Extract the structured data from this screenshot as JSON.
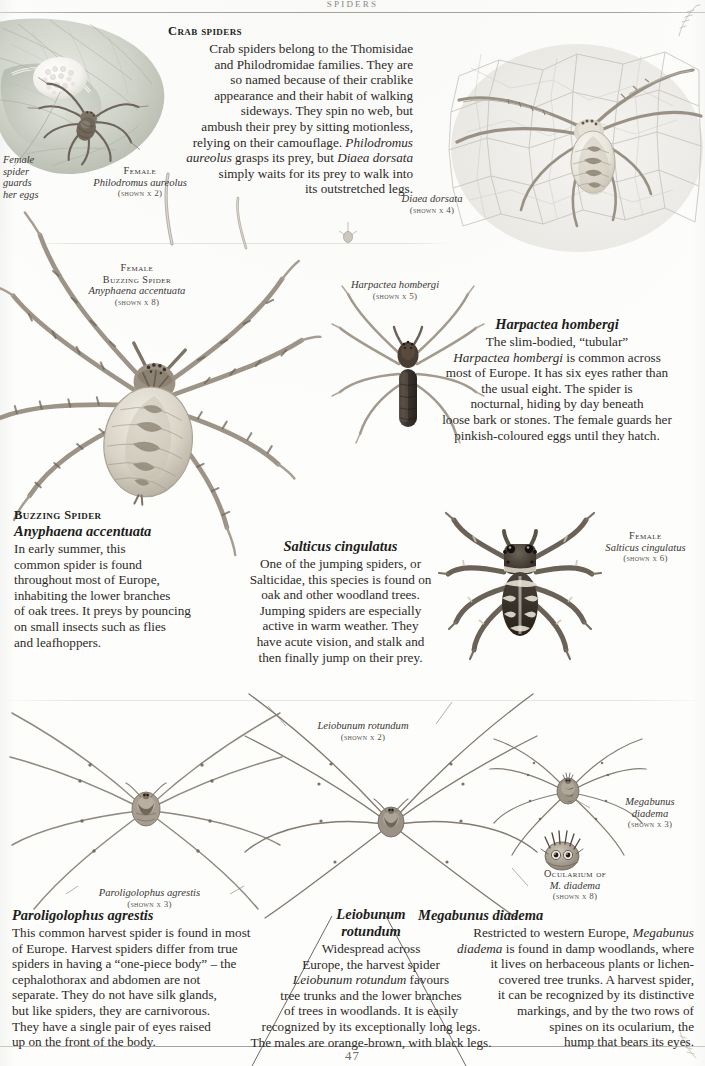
{
  "page": {
    "running_head": "SPIDERS",
    "page_number": "47"
  },
  "sections": {
    "crab_spiders": {
      "heading": "Crab spiders",
      "body": "Crab spiders belong to the Thomisidae and Philodromidae families. They are so named because of their crablike appearance and their habit of walking sideways. They spin no web, but ambush their prey by sitting motionless, relying on their camouflage. Philodromus aureolus grasps its prey, but Diaea dorsata simply waits for its prey to walk into its outstretched legs.",
      "body_lines": [
        "Crab spiders belong to the Thomisidae",
        "and Philodromidae families. They are",
        "so named because of their crablike",
        "appearance and their habit of walking",
        "sideways. They spin no web, but",
        "ambush their prey by sitting motionless,",
        "relying on their camouflage. <i>Philodromus</i>",
        "<i>aureolus</i> grasps its prey, but <i>Diaea dorsata</i>",
        "simply waits for its prey to walk into",
        "its outstretched legs."
      ]
    },
    "harpactea": {
      "heading": "Harpactea hombergi",
      "body_lines": [
        "The slim-bodied, “tubular”",
        "<i>Harpactea hombergi</i> is common across",
        "most of Europe. It has six eyes rather than",
        "the usual eight. The spider is",
        "nocturnal, hiding by day beneath",
        "loose bark or stones. The female guards her",
        "pinkish-coloured eggs until they hatch."
      ]
    },
    "buzzing_spider": {
      "heading_sc": "Buzzing Spider",
      "heading_it": "Anyphaena accentuata",
      "body_lines": [
        "In early summer, this",
        "common spider is found",
        "throughout most of Europe,",
        "inhabiting the lower branches",
        "of oak trees. It preys by pouncing",
        "on small insects such as flies",
        "and leafhoppers."
      ]
    },
    "salticus": {
      "heading": "Salticus cingulatus",
      "body_lines": [
        "One of the jumping spiders, or",
        "Salticidae, this species is found on",
        "oak and other woodland trees.",
        "Jumping spiders are especially",
        "active in warm weather. They",
        "have acute vision, and stalk and",
        "then finally jump on their prey."
      ]
    },
    "paroligolophus": {
      "heading": "Paroligolophus agrestis",
      "body_lines": [
        "This common harvest spider is found in most",
        "of Europe. Harvest spiders differ from true",
        "spiders in having a “one-piece body” – the",
        "cephalothorax and abdomen are not",
        "separate. They do not have silk glands,",
        "but like spiders, they are carnivorous.",
        "They have a single pair of eyes raised",
        "up on the front of the body."
      ]
    },
    "leiobunum": {
      "heading_line1": "Leiobunum",
      "heading_line2": "rotundum",
      "body_lines": [
        "Widespread across",
        "Europe, the harvest spider",
        "<i>Leiobunum rotundum</i> favours",
        "tree trunks and the lower branches",
        "of trees in woodlands. It is easily",
        "recognized by its exceptionally long legs.",
        "The males are orange-brown, with black legs."
      ]
    },
    "megabunus": {
      "heading": "Megabunus diadema",
      "body_lines": [
        "Restricted to western Europe, <i>Megabunus</i>",
        "<i>diadema</i> is found in damp woodlands, where",
        "it lives on herbaceous plants or lichen-",
        "covered tree trunks. A harvest spider,",
        "it can be recognized by its distinctive",
        "markings, and by the two rows of",
        "spines on its ocularium, the",
        "hump that bears its eyes."
      ]
    }
  },
  "captions": {
    "female_eggs_note": {
      "lines": [
        "Female",
        "spider",
        "guards",
        "her eggs"
      ]
    },
    "philodromus": {
      "sc": "Female",
      "it": "Philodromus aureolus",
      "scale": "(shown x 2)"
    },
    "diaea": {
      "it": "Diaea dorsata",
      "scale": "(shown x 4)"
    },
    "anyphaena": {
      "sc1": "Female",
      "sc2": "Buzzing Spider",
      "it": "Anyphaena accentuata",
      "scale": "(shown x 8)"
    },
    "harpactea_label": {
      "it": "Harpactea hombergi",
      "scale": "(shown x 5)"
    },
    "salticus_label": {
      "sc": "Female",
      "it": "Salticus cingulatus",
      "scale": "(shown x 6)"
    },
    "leiobunum_label": {
      "it": "Leiobunum rotundum",
      "scale": "(shown x 2)"
    },
    "megabunus_label": {
      "it1": "Megabunus",
      "it2": "diadema",
      "scale": "(shown x 3)"
    },
    "ocularium_label": {
      "sc": "Ocularium of",
      "it": "M. diadema",
      "scale": "(shown x 8)"
    },
    "paroligolophus_label": {
      "it": "Paroligolophus agrestis",
      "scale": "(shown x 3)"
    }
  },
  "colors": {
    "ink": "#2d2a26",
    "rule": "#a5a29c",
    "leaf": "#c9ccc0",
    "web": "#d8d6d0",
    "spider_body": "#8d8277"
  }
}
